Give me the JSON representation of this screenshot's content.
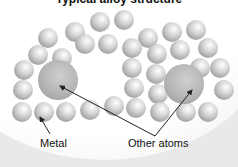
{
  "diagram": {
    "title": "Typical alloy structure",
    "labels": {
      "metal": "Metal",
      "other_atoms": "Other atoms"
    },
    "atoms": {
      "small_radius": 10,
      "small": [
        [
          48,
          38
        ],
        [
          75,
          32
        ],
        [
          100,
          22
        ],
        [
          124,
          20
        ],
        [
          148,
          38
        ],
        [
          172,
          32
        ],
        [
          196,
          30
        ],
        [
          38,
          55
        ],
        [
          62,
          58
        ],
        [
          85,
          44
        ],
        [
          108,
          44
        ],
        [
          132,
          48
        ],
        [
          157,
          54
        ],
        [
          180,
          50
        ],
        [
          208,
          48
        ],
        [
          24,
          70
        ],
        [
          132,
          68
        ],
        [
          156,
          74
        ],
        [
          200,
          68
        ],
        [
          220,
          68
        ],
        [
          23,
          90
        ],
        [
          134,
          88
        ],
        [
          158,
          94
        ],
        [
          224,
          90
        ],
        [
          22,
          112
        ],
        [
          44,
          112
        ],
        [
          66,
          112
        ],
        [
          90,
          110
        ],
        [
          114,
          106
        ],
        [
          136,
          108
        ],
        [
          160,
          112
        ],
        [
          186,
          112
        ],
        [
          208,
          112
        ]
      ],
      "large": [
        [
          58,
          80,
          20
        ],
        [
          184,
          84,
          20
        ]
      ]
    },
    "arrows": [
      {
        "from": [
          50,
          134
        ],
        "to": [
          40,
          117
        ]
      },
      {
        "from": [
          155,
          136
        ],
        "to": [
          60,
          86
        ]
      },
      {
        "from": [
          155,
          136
        ],
        "to": [
          192,
          90
        ]
      }
    ],
    "colors": {
      "background": "#e9e9e9",
      "disc": "#ffffff",
      "text": "#111111",
      "arrow": "#222222"
    }
  }
}
